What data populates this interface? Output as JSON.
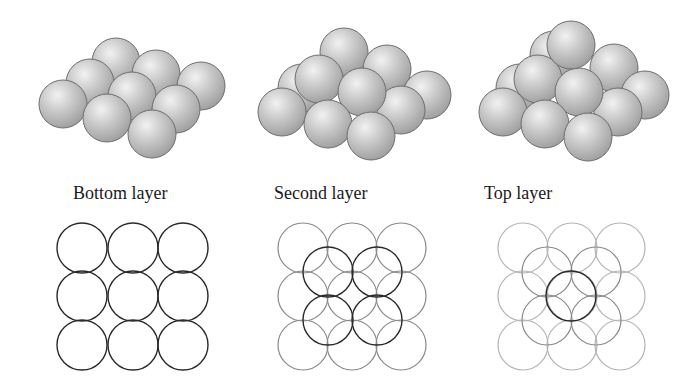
{
  "panels": [
    {
      "label": "Bottom layer",
      "label_x": 73,
      "spheres": [
        {
          "x": 116,
          "y": 62
        },
        {
          "x": 156,
          "y": 74
        },
        {
          "x": 201,
          "y": 86
        },
        {
          "x": 90,
          "y": 83
        },
        {
          "x": 132,
          "y": 96
        },
        {
          "x": 176,
          "y": 109
        },
        {
          "x": 63,
          "y": 104
        },
        {
          "x": 107,
          "y": 118
        },
        {
          "x": 152,
          "y": 134
        }
      ],
      "circles": [
        {
          "x": 82,
          "y": 248,
          "tone": "dark"
        },
        {
          "x": 133,
          "y": 248,
          "tone": "dark"
        },
        {
          "x": 183,
          "y": 248,
          "tone": "dark"
        },
        {
          "x": 82,
          "y": 296,
          "tone": "dark"
        },
        {
          "x": 133,
          "y": 296,
          "tone": "dark"
        },
        {
          "x": 183,
          "y": 296,
          "tone": "dark"
        },
        {
          "x": 82,
          "y": 345,
          "tone": "dark"
        },
        {
          "x": 133,
          "y": 345,
          "tone": "dark"
        },
        {
          "x": 183,
          "y": 345,
          "tone": "dark"
        }
      ]
    },
    {
      "label": "Second layer",
      "label_x": 274,
      "spheres": [
        {
          "x": 344,
          "y": 52
        },
        {
          "x": 387,
          "y": 69
        },
        {
          "x": 427,
          "y": 95
        },
        {
          "x": 302,
          "y": 88
        },
        {
          "x": 401,
          "y": 110
        },
        {
          "x": 319,
          "y": 79
        },
        {
          "x": 362,
          "y": 92
        },
        {
          "x": 282,
          "y": 112
        },
        {
          "x": 328,
          "y": 124
        },
        {
          "x": 371,
          "y": 136
        }
      ],
      "circles": [
        {
          "x": 303,
          "y": 248,
          "tone": "mid"
        },
        {
          "x": 352,
          "y": 248,
          "tone": "mid"
        },
        {
          "x": 401,
          "y": 248,
          "tone": "mid"
        },
        {
          "x": 303,
          "y": 296,
          "tone": "mid"
        },
        {
          "x": 352,
          "y": 296,
          "tone": "mid"
        },
        {
          "x": 401,
          "y": 296,
          "tone": "mid"
        },
        {
          "x": 303,
          "y": 345,
          "tone": "mid"
        },
        {
          "x": 352,
          "y": 345,
          "tone": "mid"
        },
        {
          "x": 401,
          "y": 345,
          "tone": "mid"
        },
        {
          "x": 328,
          "y": 272,
          "tone": "dark"
        },
        {
          "x": 377,
          "y": 272,
          "tone": "dark"
        },
        {
          "x": 328,
          "y": 320,
          "tone": "dark"
        },
        {
          "x": 377,
          "y": 320,
          "tone": "dark"
        }
      ]
    },
    {
      "label": "Top layer",
      "label_x": 484,
      "spheres": [
        {
          "x": 554,
          "y": 55
        },
        {
          "x": 614,
          "y": 68
        },
        {
          "x": 645,
          "y": 95
        },
        {
          "x": 520,
          "y": 88
        },
        {
          "x": 618,
          "y": 112
        },
        {
          "x": 538,
          "y": 79
        },
        {
          "x": 579,
          "y": 92
        },
        {
          "x": 571,
          "y": 45
        },
        {
          "x": 503,
          "y": 112
        },
        {
          "x": 545,
          "y": 124
        },
        {
          "x": 588,
          "y": 137
        }
      ],
      "circles": [
        {
          "x": 523,
          "y": 248,
          "tone": "light"
        },
        {
          "x": 572,
          "y": 248,
          "tone": "light"
        },
        {
          "x": 620,
          "y": 248,
          "tone": "light"
        },
        {
          "x": 523,
          "y": 296,
          "tone": "light"
        },
        {
          "x": 572,
          "y": 296,
          "tone": "light"
        },
        {
          "x": 620,
          "y": 296,
          "tone": "light"
        },
        {
          "x": 523,
          "y": 345,
          "tone": "light"
        },
        {
          "x": 572,
          "y": 345,
          "tone": "light"
        },
        {
          "x": 620,
          "y": 345,
          "tone": "light"
        },
        {
          "x": 547,
          "y": 272,
          "tone": "mid"
        },
        {
          "x": 596,
          "y": 272,
          "tone": "mid"
        },
        {
          "x": 547,
          "y": 320,
          "tone": "mid"
        },
        {
          "x": 596,
          "y": 320,
          "tone": "mid"
        },
        {
          "x": 571,
          "y": 296,
          "tone": "dark"
        }
      ]
    }
  ],
  "sphere_radius": 24,
  "circle_radius": 25,
  "colors": {
    "background": "#ffffff",
    "sphere_highlight": "#ececec",
    "sphere_base": "#c4c4c4",
    "sphere_shadow": "#9c9c9c",
    "sphere_outline": "#6e6e6e",
    "circle_dark": "#2a2a2a",
    "circle_mid": "#8a8a8a",
    "circle_light": "#b4b4b4",
    "text": "#1a1a1a"
  }
}
